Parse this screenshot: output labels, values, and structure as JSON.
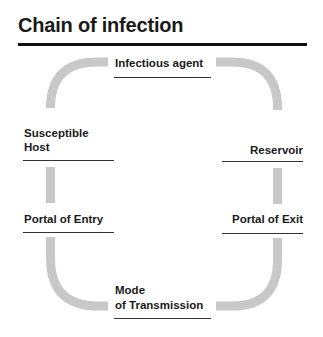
{
  "title": "Chain of infection",
  "colors": {
    "arc": "#c8c8c8",
    "text": "#1a1a1a",
    "rule": "#333333"
  },
  "nodes": {
    "infectious_agent": "Infectious agent",
    "reservoir": "Reservoir",
    "portal_of_exit": "Portal of Exit",
    "mode_line1": "Mode",
    "mode_line2": "of Transmission",
    "portal_of_entry": "Portal of Entry",
    "susceptible_line1": "Susceptible",
    "susceptible_line2": "Host"
  }
}
